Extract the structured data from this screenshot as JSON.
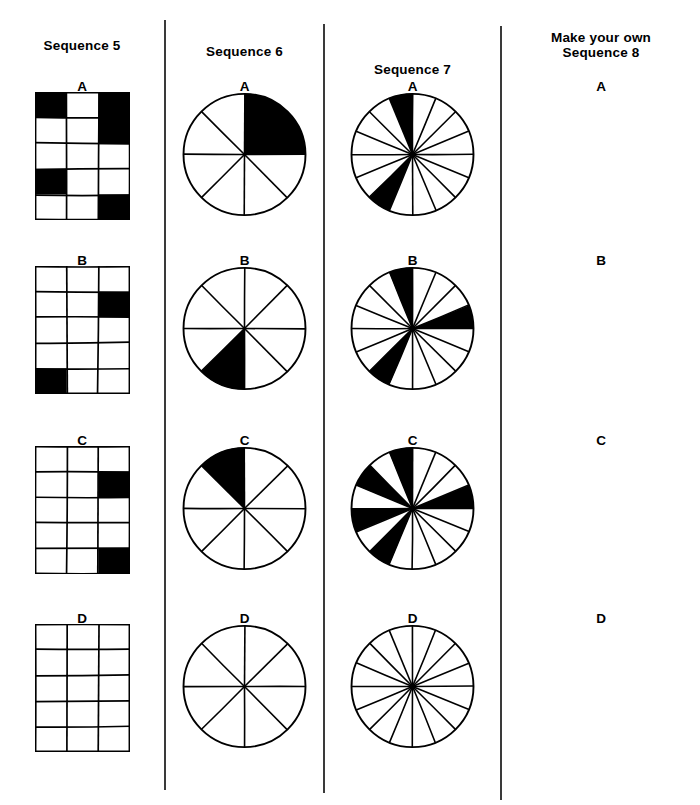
{
  "page": {
    "background": "#ffffff",
    "ink": "#000000"
  },
  "columns": [
    {
      "id": "sequence-5",
      "heading": "Sequence 5",
      "heading_lines": [
        "Sequence 5"
      ],
      "figure_type": "grid",
      "grid": {
        "cols": 3,
        "rows": 5
      },
      "items": [
        {
          "label": "A",
          "filled_cells": [
            [
              0,
              0
            ],
            [
              0,
              2
            ],
            [
              1,
              2
            ],
            [
              3,
              0
            ],
            [
              4,
              2
            ]
          ]
        },
        {
          "label": "B",
          "filled_cells": [
            [
              1,
              2
            ],
            [
              4,
              0
            ]
          ]
        },
        {
          "label": "C",
          "filled_cells": [
            [
              1,
              2
            ],
            [
              4,
              2
            ]
          ]
        },
        {
          "label": "D",
          "filled_cells": []
        }
      ]
    },
    {
      "id": "sequence-6",
      "heading": "Sequence 6",
      "heading_lines": [
        "Sequence 6"
      ],
      "figure_type": "pie",
      "pie": {
        "segments": 8
      },
      "items": [
        {
          "label": "A",
          "filled_segments": [
            0,
            1
          ]
        },
        {
          "label": "B",
          "filled_segments": [
            4
          ]
        },
        {
          "label": "C",
          "filled_segments": [
            7
          ]
        },
        {
          "label": "D",
          "filled_segments": []
        }
      ]
    },
    {
      "id": "sequence-7",
      "heading": "Sequence 7",
      "heading_lines": [
        "Sequence 7"
      ],
      "figure_type": "pie",
      "pie": {
        "segments": 16
      },
      "items": [
        {
          "label": "A",
          "filled_segments": [
            15,
            9
          ]
        },
        {
          "label": "B",
          "filled_segments": [
            15,
            3,
            9
          ]
        },
        {
          "label": "C",
          "filled_segments": [
            15,
            13,
            3,
            9,
            11
          ]
        },
        {
          "label": "D",
          "filled_segments": []
        }
      ]
    },
    {
      "id": "sequence-8",
      "heading": "Make your own Sequence 8",
      "heading_lines": [
        "Make your own",
        "Sequence 8"
      ],
      "figure_type": "blank",
      "items": [
        {
          "label": "A",
          "filled_segments": []
        },
        {
          "label": "B",
          "filled_segments": []
        },
        {
          "label": "C",
          "filled_segments": []
        },
        {
          "label": "D",
          "filled_segments": []
        }
      ]
    }
  ],
  "layout": {
    "column_x": [
      0,
      166,
      325,
      502
    ],
    "column_w": [
      164,
      157,
      175,
      198
    ],
    "divider_x": [
      164,
      323,
      500
    ],
    "divider_top": [
      20,
      24,
      26
    ],
    "divider_bottom": [
      790,
      793,
      800
    ],
    "heading_y": [
      38,
      44,
      62,
      30
    ],
    "row_label_y": [
      80,
      254,
      434,
      612
    ],
    "row_figure_y": [
      92,
      266,
      446,
      624
    ],
    "grid_w": 95,
    "grid_h": 128,
    "circle_d": 125
  }
}
